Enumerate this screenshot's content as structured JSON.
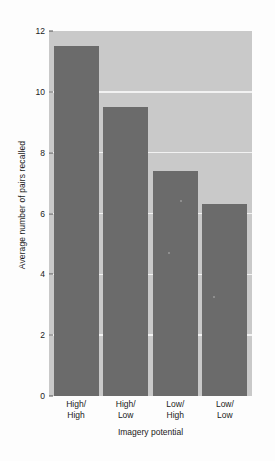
{
  "chart_data": {
    "type": "bar",
    "title": "",
    "xlabel": "Imagery potential",
    "ylabel": "Average number of pairs recalled",
    "categories": [
      "High/\nHigh",
      "High/\nLow",
      "Low/\nHigh",
      "Low/\nLow"
    ],
    "category_lines": [
      [
        "High/",
        "High"
      ],
      [
        "High/",
        "Low"
      ],
      [
        "Low/",
        "High"
      ],
      [
        "Low/",
        "Low"
      ]
    ],
    "values": [
      11.5,
      9.5,
      7.4,
      6.3
    ],
    "ylim": [
      0,
      12
    ],
    "yticks": [
      0,
      2,
      4,
      6,
      8,
      10,
      12
    ],
    "ytick_labels": [
      "0",
      "2",
      "4",
      "6",
      "8",
      "10",
      "12"
    ],
    "grid": true,
    "grid_axis": "y",
    "legend": null,
    "bar_color": "#6b6b6b",
    "plot_background": "#c9c9c9",
    "gridline_color": "#f2f2f2",
    "figure_background": "#fdfdfd",
    "axis_color": "#5a5a5a"
  }
}
